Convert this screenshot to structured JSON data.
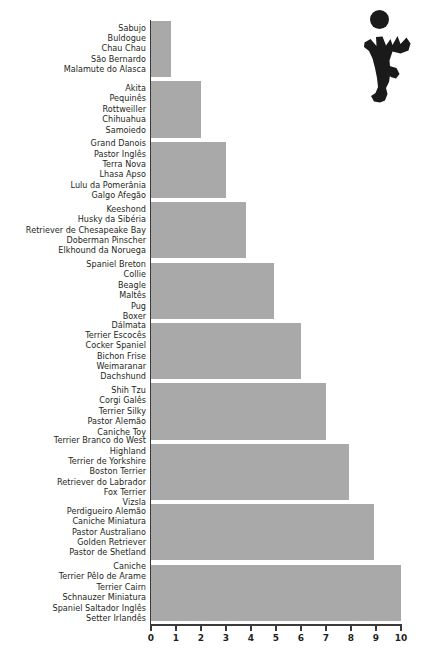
{
  "chart_data": {
    "type": "bar",
    "orientation": "horizontal",
    "title": "",
    "xlabel": "",
    "ylabel": "",
    "xlim": [
      0,
      10
    ],
    "grid": false,
    "legend": false,
    "bar_color": "#a9a9a9",
    "axis_color": "#3a3a3a",
    "text_color": "#231f20",
    "xticks": [
      "0",
      "1",
      "2",
      "3",
      "4",
      "5",
      "6",
      "7",
      "8",
      "9",
      "10"
    ],
    "categories": [
      "Sabujo / Buldogue / Chau Chau / São Bernardo / Malamute do Alasca",
      "Akita / Pequinês / Rottweiller / Chihuahua / Samoiedo",
      "Grand Danois / Pastor Inglês / Terra Nova / Lhasa Apso / Lulu da Pomerânia / Galgo Afegão",
      "Keeshond / Husky da Sibéria / Retriever de Chesapeake Bay / Doberman Pinscher / Elkhound da Noruega",
      "Spaniel Breton / Collie / Beagle / Maltês / Pug / Boxer",
      "Dálmata / Terrier Escocês / Cocker Spaniel / Bichon Frise / Weimaranar / Dachshund",
      "Shih Tzu / Corgi Galês / Terrier Silky / Pastor Alemão / Caniche Toy",
      "Terrier Branco do West Highland / Terrier de Yorkshire / Boston Terrier / Retriever do Labrador / Fox Terrier / Vizsla",
      "Perdigueiro Alemão / Caniche Miniatura / Pastor Australiano / Golden Retriever / Pastor de Shetland",
      "Caniche / Terrier Pêlo de Arame / Terrier Cairn / Schnauzer Miniatura / Spaniel Saltador Inglês / Setter Irlandês"
    ],
    "values": [
      0.8,
      2.0,
      3.0,
      3.8,
      4.9,
      6.0,
      7.0,
      7.9,
      8.9,
      10.0
    ]
  },
  "groups": [
    {
      "value": 0.8,
      "labels": [
        "Sabujo",
        "Buldogue",
        "Chau Chau",
        "São Bernardo",
        "Malamute do Alasca"
      ]
    },
    {
      "value": 2.0,
      "labels": [
        "Akita",
        "Pequinês",
        "Rottweiller",
        "Chihuahua",
        "Samoiedo"
      ]
    },
    {
      "value": 3.0,
      "labels": [
        "Grand Danois",
        "Pastor Inglês",
        "Terra Nova",
        "Lhasa Apso",
        "Lulu da Pomerânia",
        "Galgo Afegão"
      ]
    },
    {
      "value": 3.8,
      "labels": [
        "Keeshond",
        "Husky da Sibéria",
        "Retriever de Chesapeake Bay",
        "Doberman Pinscher",
        "Elkhound da Noruega"
      ]
    },
    {
      "value": 4.9,
      "labels": [
        "Spaniel Breton",
        "Collie",
        "Beagle",
        "Maltês",
        "Pug",
        "Boxer"
      ]
    },
    {
      "value": 6.0,
      "labels": [
        "Dálmata",
        "Terrier Escocês",
        "Cocker Spaniel",
        "Bichon Frise",
        "Weimaranar",
        "Dachshund"
      ]
    },
    {
      "value": 7.0,
      "labels": [
        "Shih Tzu",
        "Corgi Galês",
        "Terrier Silky",
        "Pastor Alemão",
        "Caniche Toy"
      ]
    },
    {
      "value": 7.9,
      "labels": [
        "Terrier Branco do West",
        "Highland",
        "Terrier de Yorkshire",
        "Boston Terrier",
        "Retriever do Labrador",
        "Fox Terrier",
        "Vizsla"
      ]
    },
    {
      "value": 8.9,
      "labels": [
        "Perdigueiro Alemão",
        "Caniche Miniatura",
        "Pastor Australiano",
        "Golden Retriever",
        "Pastor de Shetland"
      ]
    },
    {
      "value": 10.0,
      "labels": [
        "Caniche",
        "Terrier Pêlo de Arame",
        "Terrier Cairn",
        "Schnauzer Miniatura",
        "Spaniel Saltador Inglês",
        "Setter Irlandês"
      ]
    }
  ],
  "decoration": {
    "icon": "jumping-person-with-ball-silhouette",
    "color": "#1a1a1a"
  }
}
